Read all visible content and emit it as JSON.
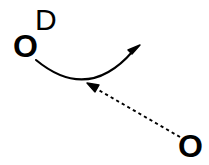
{
  "diagram": {
    "type": "reaction-mechanism",
    "background_color": "#ffffff",
    "stroke_color": "#000000",
    "atoms": [
      {
        "id": "o-left",
        "symbol": "O",
        "x": 27,
        "y": 46,
        "role": "nucleophile-source"
      },
      {
        "id": "o-right",
        "symbol": "O",
        "x": 192,
        "y": 147,
        "role": "electrophile-target"
      }
    ],
    "labels": [
      {
        "id": "d-label",
        "text": "D",
        "x": 46,
        "y": 20
      }
    ],
    "arrows": [
      {
        "id": "curved-arrow",
        "style": "solid",
        "description": "curved electron-pushing arrow",
        "from_x": 36,
        "from_y": 60,
        "to_x": 140,
        "to_y": 46,
        "control_x": 88,
        "control_y": 96,
        "head": "tip-up-right"
      },
      {
        "id": "dashed-arrow",
        "style": "dashed",
        "description": "dashed arrow pointing at the curved arrow",
        "from_x": 185,
        "from_y": 140,
        "to_x": 88,
        "to_y": 84,
        "head": "tip-up-left"
      }
    ]
  }
}
